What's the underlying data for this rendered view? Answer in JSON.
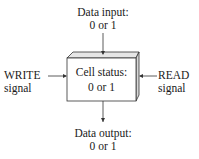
{
  "diagram": {
    "input": {
      "line1": "Data input:",
      "line2": "0 or 1"
    },
    "cell": {
      "line1": "Cell status:",
      "line2": "0 or 1"
    },
    "write": {
      "line1": "WRITE",
      "line2": "signal"
    },
    "read": {
      "line1": "READ",
      "line2": "signal"
    },
    "output": {
      "line1": "Data output:",
      "line2": "0 or 1"
    },
    "colors": {
      "line": "#333333",
      "box_face": "#ffffff",
      "box_side": "#d8d8d8",
      "box_top": "#e6e6e6"
    }
  }
}
